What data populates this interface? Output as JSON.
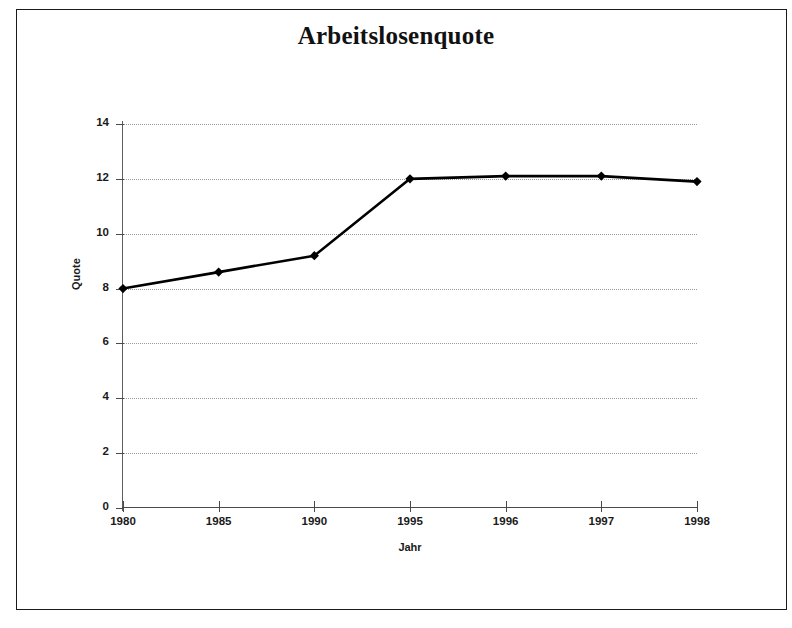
{
  "chart_data": {
    "type": "line",
    "title": "Arbeitslosenquote",
    "xlabel": "Jahr",
    "ylabel": "Quote",
    "categories": [
      "1980",
      "1985",
      "1990",
      "1995",
      "1996",
      "1997",
      "1998"
    ],
    "values": [
      8.0,
      8.6,
      9.2,
      12.0,
      12.1,
      12.1,
      11.9
    ],
    "series": [
      {
        "name": "Arbeitslosenquote",
        "values": [
          8.0,
          8.6,
          9.2,
          12.0,
          12.1,
          12.1,
          11.9
        ]
      }
    ],
    "ylim": [
      0,
      14
    ],
    "ytick_labels": [
      "0",
      "2",
      "4",
      "6",
      "8",
      "10",
      "12",
      "14"
    ],
    "ytick_values": [
      0,
      2,
      4,
      6,
      8,
      10,
      12,
      14
    ],
    "grid": "horizontal-dotted",
    "legend": "none",
    "line_color": "#000000",
    "marker": "diamond",
    "marker_color": "#000000",
    "grid_color": "#9a9a9a",
    "axis_color": "#4a4a4a",
    "background": "#ffffff"
  },
  "figure": {
    "border_color": "#1a1a1a"
  }
}
